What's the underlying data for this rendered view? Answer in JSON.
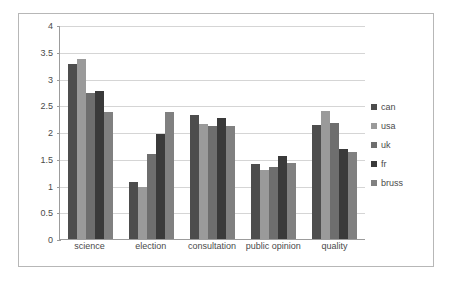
{
  "chart_data": {
    "type": "bar",
    "title": "",
    "xlabel": "",
    "ylabel": "",
    "ylim": [
      0,
      4
    ],
    "ytick_step": 0.5,
    "yticks": [
      "4",
      "3.5",
      "3",
      "2.5",
      "2",
      "1.5",
      "1",
      "0.5",
      "0"
    ],
    "ytick_values": [
      4,
      3.5,
      3,
      2.5,
      2,
      1.5,
      1,
      0.5,
      0
    ],
    "grid": true,
    "grid_axis": "y",
    "legend_position": "right",
    "categories": [
      "science",
      "election",
      "consultation",
      "public opinion",
      "quality"
    ],
    "series": [
      {
        "name": "can",
        "color": "#4d4d4d",
        "values": [
          3.27,
          1.07,
          2.31,
          1.41,
          2.14
        ]
      },
      {
        "name": "usa",
        "color": "#9a9a9a",
        "values": [
          3.37,
          0.97,
          2.15,
          1.29,
          2.4
        ]
      },
      {
        "name": "uk",
        "color": "#6e6e6e",
        "values": [
          2.73,
          1.58,
          2.11,
          1.34,
          2.17
        ]
      },
      {
        "name": "fr",
        "color": "#3a3a3a",
        "values": [
          2.76,
          1.97,
          2.27,
          1.56,
          1.68
        ]
      },
      {
        "name": "bruss",
        "color": "#808080",
        "values": [
          2.38,
          2.38,
          2.12,
          1.42,
          1.62
        ]
      }
    ]
  },
  "legend": {
    "items": [
      {
        "label": "can"
      },
      {
        "label": "usa"
      },
      {
        "label": "uk"
      },
      {
        "label": "fr"
      },
      {
        "label": "bruss"
      }
    ]
  },
  "colors": {
    "frame_border": "#b7b7b7",
    "axis_line": "#9c9c9c",
    "gridline": "#d5d5d5",
    "text": "#4a4a4a",
    "background": "#ffffff"
  }
}
